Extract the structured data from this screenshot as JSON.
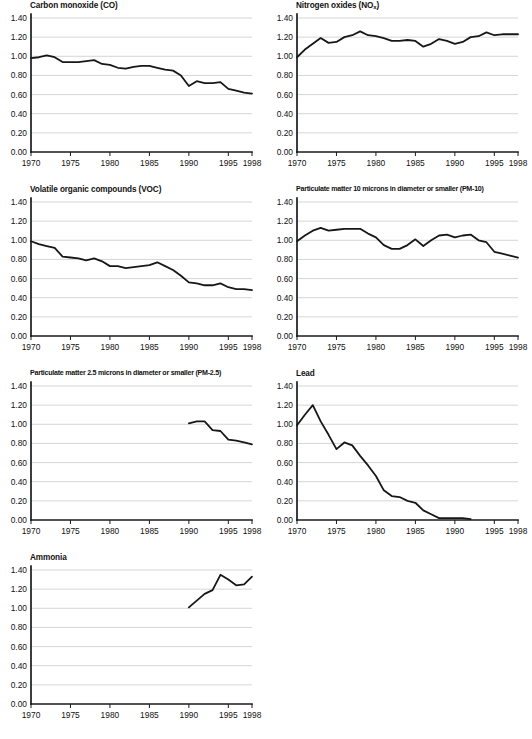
{
  "figure": {
    "width": 532,
    "height": 739,
    "background": "#ffffff",
    "line_color": "#17171a",
    "grid_color": "#b8b8b8",
    "axis_color": "#1a1a1a"
  },
  "axes": {
    "y_ticks": [
      "0.00",
      "0.20",
      "0.40",
      "0.60",
      "0.80",
      "1.00",
      "1.20",
      "1.40"
    ],
    "x_ticks": [
      "1970",
      "1975",
      "1980",
      "1985",
      "1990",
      "1995",
      "1998"
    ],
    "ylim": [
      0.0,
      1.4
    ],
    "xlim": [
      1970,
      1998
    ],
    "grid": "horizontal"
  },
  "chart_data": [
    {
      "type": "line",
      "title": "Carbon monoxide (CO)",
      "title_html": "Carbon monoxide (CO)",
      "xlabel": "",
      "ylabel": "",
      "xlim": [
        1970,
        1998
      ],
      "ylim": [
        0.0,
        1.4
      ],
      "xticks": [
        1970,
        1975,
        1980,
        1985,
        1990,
        1995,
        1998
      ],
      "yticks": [
        0.0,
        0.2,
        0.4,
        0.6,
        0.8,
        1.0,
        1.2,
        1.4
      ],
      "grid": true,
      "legend": "none",
      "x": [
        1970,
        1971,
        1972,
        1973,
        1974,
        1975,
        1976,
        1977,
        1978,
        1979,
        1980,
        1981,
        1982,
        1983,
        1984,
        1985,
        1986,
        1987,
        1988,
        1989,
        1990,
        1991,
        1992,
        1993,
        1994,
        1995,
        1996,
        1997,
        1998
      ],
      "values": [
        0.98,
        0.99,
        1.01,
        0.99,
        0.94,
        0.94,
        0.94,
        0.95,
        0.96,
        0.92,
        0.91,
        0.88,
        0.87,
        0.89,
        0.9,
        0.9,
        0.88,
        0.86,
        0.85,
        0.8,
        0.69,
        0.74,
        0.72,
        0.72,
        0.73,
        0.66,
        0.64,
        0.62,
        0.61
      ]
    },
    {
      "type": "line",
      "title": "Nitrogen oxides (NOx)",
      "title_html": "Nitrogen oxides (NO<sub>x</sub>)",
      "xlabel": "",
      "ylabel": "",
      "xlim": [
        1970,
        1998
      ],
      "ylim": [
        0.0,
        1.4
      ],
      "xticks": [
        1970,
        1975,
        1980,
        1985,
        1990,
        1995,
        1998
      ],
      "yticks": [
        0.0,
        0.2,
        0.4,
        0.6,
        0.8,
        1.0,
        1.2,
        1.4
      ],
      "grid": true,
      "legend": "none",
      "x": [
        1970,
        1971,
        1972,
        1973,
        1974,
        1975,
        1976,
        1977,
        1978,
        1979,
        1980,
        1981,
        1982,
        1983,
        1984,
        1985,
        1986,
        1987,
        1988,
        1989,
        1990,
        1991,
        1992,
        1993,
        1994,
        1995,
        1996,
        1997,
        1998
      ],
      "values": [
        0.99,
        1.07,
        1.13,
        1.19,
        1.14,
        1.15,
        1.2,
        1.22,
        1.26,
        1.22,
        1.21,
        1.19,
        1.16,
        1.16,
        1.17,
        1.16,
        1.1,
        1.13,
        1.18,
        1.16,
        1.13,
        1.15,
        1.2,
        1.21,
        1.25,
        1.22,
        1.23,
        1.23,
        1.23
      ]
    },
    {
      "type": "line",
      "title": "Volatile organic compounds (VOC)",
      "title_html": "Volatile organic compounds (VOC)",
      "xlabel": "",
      "ylabel": "",
      "xlim": [
        1970,
        1998
      ],
      "ylim": [
        0.0,
        1.4
      ],
      "xticks": [
        1970,
        1975,
        1980,
        1985,
        1990,
        1995,
        1998
      ],
      "yticks": [
        0.0,
        0.2,
        0.4,
        0.6,
        0.8,
        1.0,
        1.2,
        1.4
      ],
      "grid": true,
      "legend": "none",
      "x": [
        1970,
        1971,
        1972,
        1973,
        1974,
        1975,
        1976,
        1977,
        1978,
        1979,
        1980,
        1981,
        1982,
        1983,
        1984,
        1985,
        1986,
        1987,
        1988,
        1989,
        1990,
        1991,
        1992,
        1993,
        1994,
        1995,
        1996,
        1997,
        1998
      ],
      "values": [
        0.99,
        0.96,
        0.94,
        0.92,
        0.83,
        0.82,
        0.81,
        0.79,
        0.81,
        0.78,
        0.73,
        0.73,
        0.71,
        0.72,
        0.73,
        0.74,
        0.77,
        0.73,
        0.69,
        0.63,
        0.56,
        0.55,
        0.53,
        0.53,
        0.55,
        0.51,
        0.49,
        0.49,
        0.48
      ]
    },
    {
      "type": "line",
      "title": "Particulate matter 10 microns in diameter or smaller (PM-10)",
      "title_html": "Particulate matter 10 microns in diameter or smaller (PM-10)",
      "xlabel": "",
      "ylabel": "",
      "xlim": [
        1970,
        1998
      ],
      "ylim": [
        0.0,
        1.4
      ],
      "xticks": [
        1970,
        1975,
        1980,
        1985,
        1990,
        1995,
        1998
      ],
      "yticks": [
        0.0,
        0.2,
        0.4,
        0.6,
        0.8,
        1.0,
        1.2,
        1.4
      ],
      "grid": true,
      "legend": "none",
      "x": [
        1970,
        1971,
        1972,
        1973,
        1974,
        1975,
        1976,
        1977,
        1978,
        1979,
        1980,
        1981,
        1982,
        1983,
        1984,
        1985,
        1986,
        1987,
        1988,
        1989,
        1990,
        1991,
        1992,
        1993,
        1994,
        1995,
        1996,
        1997,
        1998
      ],
      "values": [
        0.99,
        1.05,
        1.1,
        1.13,
        1.1,
        1.11,
        1.12,
        1.12,
        1.12,
        1.07,
        1.03,
        0.95,
        0.91,
        0.91,
        0.95,
        1.01,
        0.94,
        1.0,
        1.05,
        1.06,
        1.03,
        1.05,
        1.06,
        1.0,
        0.98,
        0.88,
        0.86,
        0.84,
        0.82
      ]
    },
    {
      "type": "line",
      "title": "Particulate matter 2.5 microns in diameter or smaller (PM-2.5)",
      "title_html": "Particulate matter 2.5 microns in diameter or smaller (PM-2.5)",
      "xlabel": "",
      "ylabel": "",
      "xlim": [
        1970,
        1998
      ],
      "ylim": [
        0.0,
        1.4
      ],
      "xticks": [
        1970,
        1975,
        1980,
        1985,
        1990,
        1995,
        1998
      ],
      "yticks": [
        0.0,
        0.2,
        0.4,
        0.6,
        0.8,
        1.0,
        1.2,
        1.4
      ],
      "grid": true,
      "legend": "none",
      "note": "series begins in 1990",
      "x": [
        1990,
        1991,
        1992,
        1993,
        1994,
        1995,
        1996,
        1997,
        1998
      ],
      "values": [
        1.01,
        1.03,
        1.03,
        0.94,
        0.93,
        0.84,
        0.83,
        0.81,
        0.79
      ]
    },
    {
      "type": "line",
      "title": "Lead",
      "title_html": "Lead",
      "xlabel": "",
      "ylabel": "",
      "xlim": [
        1970,
        1998
      ],
      "ylim": [
        0.0,
        1.4
      ],
      "xticks": [
        1970,
        1975,
        1980,
        1985,
        1990,
        1995,
        1998
      ],
      "yticks": [
        0.0,
        0.2,
        0.4,
        0.6,
        0.8,
        1.0,
        1.2,
        1.4
      ],
      "grid": true,
      "legend": "none",
      "note": "series ends in 1992",
      "x": [
        1970,
        1971,
        1972,
        1973,
        1974,
        1975,
        1976,
        1977,
        1978,
        1979,
        1980,
        1981,
        1982,
        1983,
        1984,
        1985,
        1986,
        1987,
        1988,
        1989,
        1990,
        1991,
        1992
      ],
      "values": [
        0.99,
        1.1,
        1.2,
        1.03,
        0.89,
        0.74,
        0.81,
        0.78,
        0.67,
        0.57,
        0.46,
        0.31,
        0.25,
        0.24,
        0.2,
        0.18,
        0.1,
        0.06,
        0.02,
        0.02,
        0.02,
        0.02,
        0.01
      ]
    },
    {
      "type": "line",
      "title": "Ammonia",
      "title_html": "Ammonia",
      "xlabel": "",
      "ylabel": "",
      "xlim": [
        1970,
        1998
      ],
      "ylim": [
        0.0,
        1.4
      ],
      "xticks": [
        1970,
        1975,
        1980,
        1985,
        1990,
        1995,
        1998
      ],
      "yticks": [
        0.0,
        0.2,
        0.4,
        0.6,
        0.8,
        1.0,
        1.2,
        1.4
      ],
      "grid": true,
      "legend": "none",
      "note": "series begins in 1990",
      "x": [
        1990,
        1991,
        1992,
        1993,
        1994,
        1995,
        1996,
        1997,
        1998
      ],
      "values": [
        1.01,
        1.08,
        1.15,
        1.19,
        1.35,
        1.3,
        1.24,
        1.25,
        1.33
      ]
    }
  ],
  "panels": [
    {
      "key": "co",
      "left": 0,
      "top": 0
    },
    {
      "key": "nox",
      "left": 266,
      "top": 0
    },
    {
      "key": "voc",
      "left": 0,
      "top": 184
    },
    {
      "key": "pm10",
      "left": 266,
      "top": 184
    },
    {
      "key": "pm25",
      "left": 0,
      "top": 368
    },
    {
      "key": "lead",
      "left": 266,
      "top": 368
    },
    {
      "key": "nh3",
      "left": 0,
      "top": 552
    }
  ]
}
